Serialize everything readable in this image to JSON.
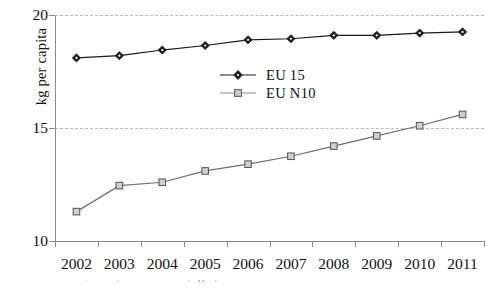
{
  "chart_data": {
    "type": "line",
    "title": "",
    "xlabel": "",
    "ylabel": "kg per capita",
    "x": [
      2002,
      2003,
      2004,
      2005,
      2006,
      2007,
      2008,
      2009,
      2010,
      2011
    ],
    "categories": [
      "2002",
      "2003",
      "2004",
      "2005",
      "2006",
      "2007",
      "2008",
      "2009",
      "2010",
      "2011"
    ],
    "ylim": [
      10,
      20
    ],
    "y_ticks": [
      10,
      15,
      20
    ],
    "y_tick_labels": [
      "10",
      "15",
      "20"
    ],
    "grid": "horizontal-dashed",
    "legend_position": "center",
    "series": [
      {
        "name": "EU 15",
        "marker": "filled-diamond",
        "color": "#1a1a1a",
        "values": [
          18.1,
          18.2,
          18.45,
          18.65,
          18.9,
          18.95,
          19.1,
          19.1,
          19.2,
          19.25
        ]
      },
      {
        "name": "EU N10",
        "marker": "open-square",
        "color": "#6f6f6f",
        "values": [
          11.3,
          12.45,
          12.6,
          13.1,
          13.4,
          13.75,
          14.2,
          14.65,
          15.1,
          15.6
        ]
      }
    ]
  },
  "legend": {
    "entries": [
      {
        "label": "EU 15"
      },
      {
        "label": "EU N10"
      }
    ]
  },
  "caption": {
    "text": "Source: EU Commission, Summary of market situation (clipped)"
  }
}
